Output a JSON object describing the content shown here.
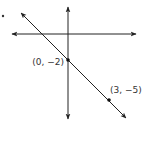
{
  "diagram": {
    "type": "coordinate-plane-line",
    "colors": {
      "stroke": "#222222",
      "label": "#333333",
      "background": "#ffffff"
    },
    "axes": {
      "x_axis": {
        "y": 34,
        "x_start": 12,
        "x_end": 136,
        "arrows": "both"
      },
      "y_axis": {
        "x": 68,
        "y_start": 7,
        "y_end": 119,
        "arrows": "both"
      }
    },
    "line": {
      "from": [
        21,
        13
      ],
      "to": [
        126,
        118
      ],
      "arrows": "both"
    },
    "points": [
      {
        "label": "(0, −2)",
        "px": [
          68,
          60
        ]
      },
      {
        "label": "(3, −5)",
        "px": [
          109,
          100
        ]
      }
    ],
    "bullet_marker": {
      "px": [
        3,
        16
      ]
    }
  }
}
